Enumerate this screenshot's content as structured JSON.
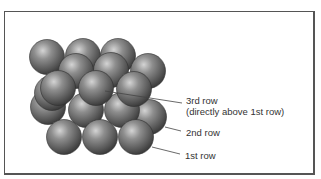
{
  "figure": {
    "labels": {
      "row3_line1": "3rd row",
      "row3_line2": "(directly above 1st row)",
      "row2": "2nd row",
      "row1": "1st row"
    },
    "colors": {
      "sphere_light": "#c8c8c8",
      "sphere_mid": "#7a7a7a",
      "sphere_dark": "#3a3a3a",
      "frame": "#555555",
      "leader": "#444444"
    }
  }
}
